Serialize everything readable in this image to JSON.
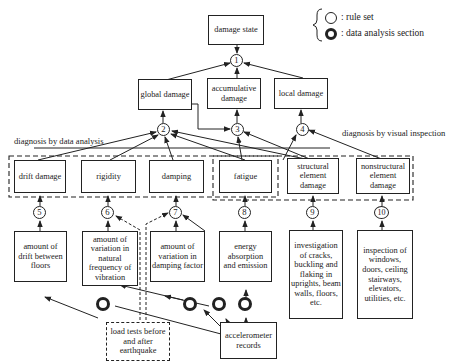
{
  "legend": {
    "rule_set_label": ": rule set",
    "data_analysis_label": ": data analysis section"
  },
  "boxes": {
    "damage_state": "damage state",
    "global_damage": "global damage",
    "accumulative_damage": "accumulative damage",
    "local_damage": "local damage",
    "drift_damage": "drift damage",
    "rigidity": "rigidity",
    "damping": "damping",
    "fatigue": "fatigue",
    "structural_element_damage": "structural element damage",
    "nonstructural_element_damage": "nonstructural element damage",
    "amount_of_drift": "amount of drift between floors",
    "variation_natural_frequency": "amount of variation in natural frequency of vibration",
    "variation_damping_factor": "amount of variation in damping factor",
    "energy_absorption": "energy absorption and emission",
    "investigation_cracks": "investigation of cracks, buckling and flaking in uprights, beam walls, floors, etc.",
    "inspection_windows": "inspection of windows, doors, ceiling stairways, elevators, utilities, etc.",
    "load_tests": "load tests before and after earthquake",
    "accelerometer_records": "accelerometer records"
  },
  "labels": {
    "diagnosis_data": "diagnosis by data analysis",
    "diagnosis_visual": "diagnosis by visual inspection"
  },
  "rule_nodes": [
    "1",
    "2",
    "3",
    "4",
    "5",
    "6",
    "7",
    "8",
    "9",
    "10"
  ]
}
